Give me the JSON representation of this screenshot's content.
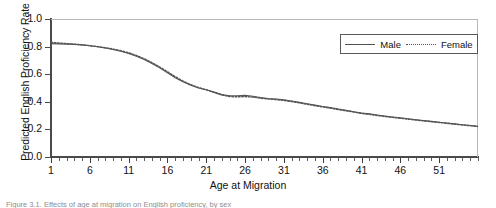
{
  "figure": {
    "caption": "Figure 3.1. Effects of age at migration on English proficiency, by sex"
  },
  "legend": {
    "position": "top-right",
    "entries": [
      {
        "label": "Male",
        "style": "solid",
        "color": "#555555"
      },
      {
        "label": "Female",
        "style": "dotted",
        "color": "#555555"
      }
    ]
  },
  "axes": {
    "ylabel": "Predicted English Proficiency Rate",
    "xlabel": "Age at Migration",
    "ytick_labels": [
      "1.0",
      "0.8",
      "0.6",
      "0.4",
      "0.2",
      "0.0"
    ],
    "xtick_labels": [
      "1",
      "6",
      "11",
      "16",
      "21",
      "26",
      "31",
      "36",
      "41",
      "46",
      "51"
    ]
  },
  "chart_data": {
    "type": "line",
    "title": "",
    "xlabel": "Age at Migration",
    "ylabel": "Predicted English Proficiency Rate",
    "xlim": [
      1,
      56
    ],
    "ylim": [
      0.0,
      1.0
    ],
    "ytick_values": [
      0.0,
      0.2,
      0.4,
      0.6,
      0.8,
      1.0
    ],
    "xtick_values": [
      1,
      6,
      11,
      16,
      21,
      26,
      31,
      36,
      41,
      46,
      51
    ],
    "xtick_minor_step": 1,
    "grid": false,
    "legend_position": "upper right",
    "x": [
      1,
      2,
      3,
      4,
      5,
      6,
      7,
      8,
      9,
      10,
      11,
      12,
      13,
      14,
      15,
      16,
      17,
      18,
      19,
      20,
      21,
      22,
      23,
      24,
      25,
      26,
      27,
      28,
      29,
      30,
      31,
      32,
      33,
      34,
      35,
      36,
      37,
      38,
      39,
      40,
      41,
      42,
      43,
      44,
      45,
      46,
      47,
      48,
      49,
      50,
      51,
      52,
      53,
      54,
      55,
      56
    ],
    "series": [
      {
        "name": "Male",
        "style": "solid",
        "color": "#555555",
        "values": [
          0.822,
          0.82,
          0.818,
          0.816,
          0.812,
          0.806,
          0.799,
          0.79,
          0.779,
          0.766,
          0.75,
          0.73,
          0.706,
          0.678,
          0.646,
          0.61,
          0.575,
          0.545,
          0.52,
          0.5,
          0.487,
          0.47,
          0.452,
          0.444,
          0.444,
          0.446,
          0.44,
          0.43,
          0.424,
          0.42,
          0.414,
          0.406,
          0.396,
          0.386,
          0.376,
          0.366,
          0.358,
          0.348,
          0.338,
          0.328,
          0.318,
          0.312,
          0.304,
          0.296,
          0.29,
          0.284,
          0.277,
          0.27,
          0.264,
          0.258,
          0.252,
          0.246,
          0.24,
          0.234,
          0.228,
          0.222
        ]
      },
      {
        "name": "Female",
        "style": "dotted",
        "color": "#555555",
        "values": [
          0.83,
          0.826,
          0.822,
          0.818,
          0.813,
          0.807,
          0.8,
          0.792,
          0.782,
          0.77,
          0.755,
          0.736,
          0.712,
          0.684,
          0.652,
          0.618,
          0.582,
          0.55,
          0.524,
          0.503,
          0.487,
          0.468,
          0.45,
          0.438,
          0.436,
          0.438,
          0.434,
          0.426,
          0.42,
          0.416,
          0.41,
          0.402,
          0.392,
          0.382,
          0.372,
          0.363,
          0.354,
          0.344,
          0.335,
          0.326,
          0.316,
          0.309,
          0.301,
          0.294,
          0.287,
          0.281,
          0.274,
          0.268,
          0.262,
          0.256,
          0.25,
          0.244,
          0.238,
          0.232,
          0.227,
          0.221
        ]
      }
    ],
    "annotations": [
      "Both sexes begin near 0.82-0.83 at age 1 and decline monotonically.",
      "Steepest decline occurs between ages 11 and 18.",
      "A plateau near 0.44 appears around ages 17-20.",
      "Curves converge near 0.22 at the oldest migration ages."
    ]
  }
}
